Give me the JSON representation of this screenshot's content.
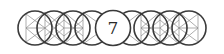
{
  "figure": {
    "center_label": "7",
    "circle_count": 9,
    "colors": {
      "stroke": "#3a3a3a",
      "inner_lines": "#8a8a8a",
      "background": "#ffffff",
      "text": "#2a2a2a"
    }
  }
}
